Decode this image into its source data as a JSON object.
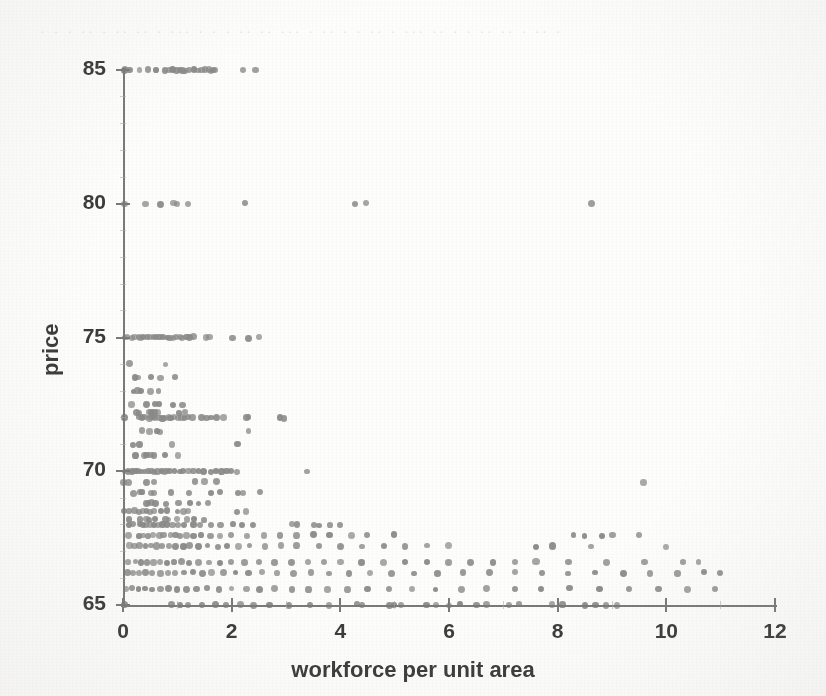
{
  "figure": {
    "kind": "scanned-scatter-plot",
    "background_color": "#fdfdfc",
    "ink_color": "#3c3c3a",
    "axis_color": "#7a7a78",
    "marker_color": "#8a8a88",
    "bleed_text": "·  ·  ·   ·· ·  ·· ··  ·   ··· ·  · ·  ··  ·· ···  · ·· ·  · ·· ·  ··· ·· · ·   ·· ·· · ·· ·"
  },
  "chart_data": {
    "type": "scatter",
    "title": "",
    "xlabel": "workforce per unit area",
    "ylabel": "price",
    "xlim": [
      0,
      12
    ],
    "ylim": [
      65,
      85
    ],
    "xticks": [
      0,
      2,
      4,
      6,
      8,
      10,
      12
    ],
    "yticks": [
      65,
      70,
      75,
      80,
      85
    ],
    "xtick_labels": [
      "0",
      "2",
      "4",
      "6",
      "8",
      "10",
      "12"
    ],
    "ytick_labels": [
      "65",
      "70",
      "75",
      "80",
      "85"
    ],
    "grid": false,
    "legend": null,
    "marker": "circle",
    "marker_size_px": 6,
    "series": [
      {
        "name": "observations",
        "color": "#8a8a88",
        "rows": [
          {
            "y": 85,
            "x": [
              0.02,
              0.05,
              0.12,
              0.3,
              0.45,
              0.62,
              0.78,
              0.85,
              0.92,
              0.98,
              1.05,
              1.1,
              1.15,
              1.22,
              1.3,
              1.38,
              1.45,
              1.52,
              1.58,
              1.62,
              1.66,
              1.7,
              2.22,
              2.45
            ]
          },
          {
            "y": 80,
            "x": [
              0.02,
              0.42,
              0.68,
              0.92,
              0.98,
              1.18,
              2.25,
              4.28,
              4.48,
              8.62
            ]
          },
          {
            "y": 75,
            "x": [
              0.02,
              0.08,
              0.15,
              0.22,
              0.28,
              0.33,
              0.38,
              0.44,
              0.5,
              0.56,
              0.62,
              0.68,
              0.74,
              0.8,
              0.86,
              0.92,
              0.98,
              1.04,
              1.1,
              1.16,
              1.22,
              1.3,
              1.52,
              1.58,
              2.02,
              2.3,
              2.5
            ]
          },
          {
            "y": 74,
            "x": [
              0.12,
              0.78
            ]
          },
          {
            "y": 73.5,
            "x": [
              0.22,
              0.28,
              0.52,
              0.68,
              0.95
            ]
          },
          {
            "y": 73,
            "x": [
              0.2,
              0.26,
              0.32,
              0.5,
              0.66
            ]
          },
          {
            "y": 72.5,
            "x": [
              0.16,
              0.42,
              0.6,
              0.66,
              0.92,
              1.1
            ]
          },
          {
            "y": 72.2,
            "x": [
              0.25,
              0.3,
              0.48,
              0.54,
              0.58,
              0.64,
              1.02,
              1.15
            ]
          },
          {
            "y": 72,
            "x": [
              0.02,
              0.3,
              0.36,
              0.42,
              0.48,
              0.52,
              0.56,
              0.6,
              0.66,
              0.72,
              0.78,
              0.84,
              0.9,
              0.96,
              1.02,
              1.08,
              1.14,
              1.2,
              1.28,
              1.45,
              1.52,
              1.62,
              1.72,
              1.84,
              2.28,
              2.32,
              2.9,
              2.96
            ]
          },
          {
            "y": 71.5,
            "x": [
              0.34,
              0.5,
              0.62,
              0.68,
              2.3
            ]
          },
          {
            "y": 71,
            "x": [
              0.18,
              0.32,
              0.9,
              2.1
            ]
          },
          {
            "y": 70.6,
            "x": [
              0.22,
              0.38,
              0.44,
              0.5,
              0.56,
              0.78,
              1.02
            ]
          },
          {
            "y": 70,
            "x": [
              0.02,
              0.08,
              0.16,
              0.22,
              0.28,
              0.34,
              0.4,
              0.46,
              0.52,
              0.58,
              0.64,
              0.7,
              0.76,
              0.82,
              0.88,
              0.96,
              1.04,
              1.12,
              1.2,
              1.3,
              1.4,
              1.5,
              1.62,
              1.72,
              1.82,
              1.92,
              2.0,
              2.1,
              3.4
            ]
          },
          {
            "y": 69.6,
            "x": [
              0.02,
              0.1,
              0.42,
              0.56,
              1.32,
              1.5,
              1.72,
              9.58
            ]
          },
          {
            "y": 69.2,
            "x": [
              0.18,
              0.3,
              0.36,
              0.52,
              0.58,
              0.88,
              1.22,
              1.6,
              1.78,
              2.12,
              2.2,
              2.52
            ]
          },
          {
            "y": 68.8,
            "x": [
              0.42,
              0.48,
              0.54,
              0.6,
              0.78,
              1.02,
              1.22,
              1.4,
              1.56
            ]
          },
          {
            "y": 68.5,
            "x": [
              0.02,
              0.12,
              0.22,
              0.3,
              0.36,
              0.42,
              0.5,
              0.58,
              0.68,
              0.82,
              1.0,
              1.12,
              1.2,
              2.1,
              2.26
            ]
          },
          {
            "y": 68.2,
            "x": [
              0.12,
              0.32,
              0.42,
              0.48,
              0.6,
              0.78,
              0.84,
              0.98,
              1.18,
              1.3,
              1.5
            ]
          },
          {
            "y": 68,
            "x": [
              0.12,
              0.18,
              0.3,
              0.36,
              0.42,
              0.5,
              0.56,
              0.64,
              0.72,
              0.8,
              0.9,
              1.0,
              1.12,
              1.3,
              1.42,
              1.62,
              1.8,
              2.02,
              2.2,
              2.4,
              3.1,
              3.2,
              3.5,
              3.6,
              3.8,
              4.0
            ]
          },
          {
            "y": 67.6,
            "x": [
              0.1,
              0.3,
              0.38,
              0.46,
              0.56,
              0.66,
              0.76,
              0.88,
              0.96,
              1.06,
              1.18,
              1.3,
              1.44,
              1.6,
              1.78,
              2.0,
              2.3,
              2.6,
              2.9,
              3.2,
              3.5,
              3.8,
              4.2,
              4.5,
              5.0,
              8.3,
              8.5,
              8.8,
              9.0,
              9.5
            ]
          },
          {
            "y": 67.2,
            "x": [
              0.12,
              0.2,
              0.3,
              0.4,
              0.5,
              0.62,
              0.72,
              0.84,
              0.96,
              1.1,
              1.24,
              1.4,
              1.56,
              1.74,
              1.92,
              2.12,
              2.34,
              2.6,
              2.9,
              3.2,
              3.6,
              4.0,
              4.4,
              4.8,
              5.2,
              5.6,
              6.0,
              7.6,
              7.9,
              8.6,
              10.0
            ]
          },
          {
            "y": 66.6,
            "x": [
              0.1,
              0.22,
              0.32,
              0.44,
              0.56,
              0.68,
              0.8,
              0.94,
              1.08,
              1.22,
              1.4,
              1.58,
              1.78,
              2.0,
              2.24,
              2.5,
              2.8,
              3.1,
              3.4,
              3.7,
              4.0,
              4.4,
              4.8,
              5.2,
              5.6,
              6.0,
              6.4,
              6.8,
              7.2,
              7.6,
              8.2,
              8.9,
              9.6,
              10.3,
              10.6
            ]
          },
          {
            "y": 66.2,
            "x": [
              0.08,
              0.18,
              0.3,
              0.42,
              0.54,
              0.68,
              0.82,
              0.96,
              1.12,
              1.28,
              1.46,
              1.64,
              1.84,
              2.06,
              2.3,
              2.56,
              2.84,
              3.14,
              3.46,
              3.8,
              4.16,
              4.54,
              4.94,
              5.36,
              5.8,
              6.26,
              6.74,
              7.2,
              7.7,
              8.2,
              8.7,
              9.2,
              9.7,
              10.2,
              10.7,
              11.0
            ]
          },
          {
            "y": 65.6,
            "x": [
              0.06,
              0.16,
              0.28,
              0.4,
              0.54,
              0.68,
              0.84,
              1.0,
              1.18,
              1.36,
              1.56,
              1.78,
              2.0,
              2.26,
              2.52,
              2.8,
              3.1,
              3.42,
              3.76,
              4.12,
              4.5,
              4.9,
              5.32,
              5.76,
              6.22,
              6.7,
              7.2,
              7.7,
              8.22,
              8.76,
              9.3,
              9.86,
              10.4,
              10.9
            ]
          },
          {
            "y": 65,
            "x": [
              0.04,
              0.9,
              1.05,
              1.2,
              1.45,
              1.7,
              1.9,
              2.15,
              2.4,
              2.7,
              3.05,
              3.45,
              3.8,
              4.3,
              4.4,
              4.9,
              5.0,
              5.1,
              5.6,
              5.75,
              6.0,
              6.2,
              6.5,
              6.7,
              7.1,
              7.3,
              7.9,
              8.1,
              8.5,
              8.7,
              8.9,
              9.1
            ]
          }
        ]
      }
    ]
  }
}
